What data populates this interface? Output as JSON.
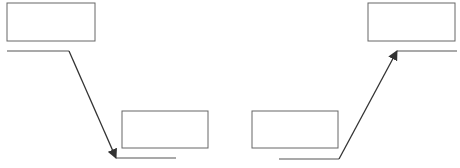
{
  "diagram": {
    "stroke_color": "#555555",
    "arrow_color": "#333333",
    "left_group": {
      "source_box": {
        "x": 7,
        "y": 3,
        "w": 88,
        "h": 38
      },
      "source_line": {
        "x1": 7,
        "y1": 51,
        "x2": 69,
        "y2": 51
      },
      "arrow": {
        "x1": 69,
        "y1": 51,
        "x2": 116,
        "y2": 158,
        "direction": "down"
      },
      "target_line": {
        "x1": 116,
        "y1": 158,
        "x2": 176,
        "y2": 158
      },
      "target_box": {
        "x": 122,
        "y": 111,
        "w": 86,
        "h": 37
      }
    },
    "right_group": {
      "source_box": {
        "x": 252,
        "y": 111,
        "w": 86,
        "h": 37
      },
      "source_line": {
        "x1": 279,
        "y1": 159,
        "x2": 339,
        "y2": 159
      },
      "arrow": {
        "x1": 339,
        "y1": 159,
        "x2": 397,
        "y2": 51,
        "direction": "up"
      },
      "target_line": {
        "x1": 397,
        "y1": 51,
        "x2": 457,
        "y2": 51
      },
      "target_box": {
        "x": 368,
        "y": 3,
        "w": 87,
        "h": 38
      }
    }
  }
}
